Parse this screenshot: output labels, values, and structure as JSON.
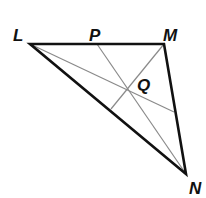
{
  "diagram": {
    "type": "triangle-with-cevians",
    "vertices": [
      {
        "id": "L",
        "label": "L",
        "x": 30,
        "y": 44,
        "label_x": 13,
        "label_y": 41
      },
      {
        "id": "M",
        "label": "M",
        "x": 164,
        "y": 44,
        "label_x": 163,
        "label_y": 41
      },
      {
        "id": "N",
        "label": "N",
        "x": 186,
        "y": 174,
        "label_x": 189,
        "label_y": 194
      }
    ],
    "points": [
      {
        "id": "P",
        "label": "P",
        "x": 97,
        "y": 44,
        "label_x": 89,
        "label_y": 41
      },
      {
        "id": "Q",
        "label": "Q",
        "x": 126,
        "y": 91,
        "label_x": 137,
        "label_y": 91
      }
    ],
    "sides": [
      {
        "from": "L",
        "to": "M"
      },
      {
        "from": "M",
        "to": "N"
      },
      {
        "from": "N",
        "to": "L"
      }
    ],
    "segments": [
      {
        "name": "P-to-N",
        "x1": 97,
        "y1": 44,
        "x2": 186,
        "y2": 174
      },
      {
        "name": "M-to-LN-foot",
        "x1": 164,
        "y1": 44,
        "x2": 111,
        "y2": 109
      },
      {
        "name": "L-to-MN",
        "x1": 30,
        "y1": 44,
        "x2": 174,
        "y2": 112
      }
    ],
    "colors": {
      "sides": "#111111",
      "segments": "#8a8a8a",
      "labels": "#111111"
    }
  }
}
